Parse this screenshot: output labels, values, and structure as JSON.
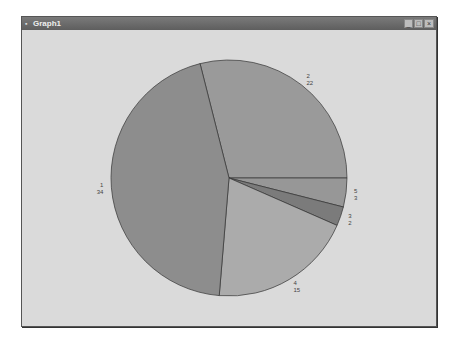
{
  "window": {
    "title": "Graph1",
    "icon": "app-icon",
    "buttons": {
      "minimize": "_",
      "maximize": "□",
      "close": "×"
    }
  },
  "colors": {
    "slice_1": "#8d8d8d",
    "slice_2": "#9a9a9a",
    "slice_5": "#979797",
    "slice_3": "#7b7b7b",
    "slice_4": "#ababab",
    "outline": "#333333"
  },
  "chart_data": {
    "type": "pie",
    "title": "",
    "categories": [
      "1",
      "2",
      "5",
      "3",
      "4"
    ],
    "values": [
      34,
      22,
      3,
      2,
      15
    ],
    "labels": [
      {
        "category": "1",
        "value": "34"
      },
      {
        "category": "2",
        "value": "22"
      },
      {
        "category": "5",
        "value": "3"
      },
      {
        "category": "3",
        "value": "2"
      },
      {
        "category": "4",
        "value": "15"
      }
    ],
    "legend": "none"
  }
}
